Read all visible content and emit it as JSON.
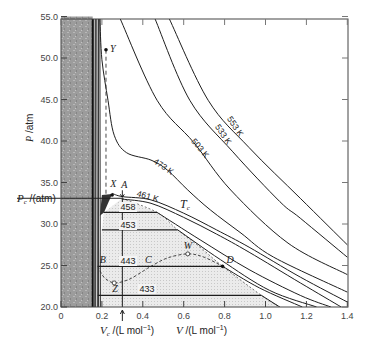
{
  "chart_data": {
    "type": "line",
    "title": "",
    "xlabel": "V /(L mol^-1)",
    "xlabel_critical": "Vc /(L mol^-1)",
    "ylabel": "P /atm",
    "ylabel_critical": "Pc /(atm)",
    "xlim": [
      0,
      1.4
    ],
    "ylim": [
      20.0,
      55.0
    ],
    "grid": false,
    "x_ticks": [
      "0",
      "0.2",
      "0.4",
      "0.6",
      "0.8",
      "1.0",
      "1.2",
      "1.4"
    ],
    "x_tick_values": [
      0,
      0.2,
      0.4,
      0.6,
      0.8,
      1.0,
      1.2,
      1.4
    ],
    "y_ticks": [
      "20.0",
      "25.0",
      "30.0",
      "35.0",
      "40.0",
      "45.0",
      "50.0",
      "55.0"
    ],
    "y_tick_values": [
      20,
      25,
      30,
      35,
      40,
      45,
      50,
      55
    ],
    "critical_point": {
      "V": 0.3,
      "P": 33.1,
      "label": "A"
    },
    "series": [
      {
        "name": "553 K",
        "label": "553 K",
        "points": [
          [
            0.53,
            54.7
          ],
          [
            0.72,
            44.9
          ],
          [
            0.92,
            39.2
          ],
          [
            1.17,
            33.1
          ],
          [
            1.4,
            27.5
          ]
        ]
      },
      {
        "name": "533 K",
        "label": "533 K",
        "points": [
          [
            0.46,
            54.7
          ],
          [
            0.63,
            44.9
          ],
          [
            0.84,
            38.7
          ],
          [
            1.07,
            32.7
          ],
          [
            1.17,
            30.7
          ],
          [
            1.4,
            26.0
          ]
        ]
      },
      {
        "name": "503 K",
        "label": "503 K",
        "points": [
          [
            0.29,
            54.7
          ],
          [
            0.47,
            44.9
          ],
          [
            0.65,
            39.8
          ],
          [
            0.83,
            34.1
          ],
          [
            1.11,
            27.7
          ],
          [
            1.4,
            23.9
          ]
        ]
      },
      {
        "name": "473 K",
        "label": "473 K",
        "points": [
          [
            0.19,
            54.7
          ],
          [
            0.2,
            49.8
          ],
          [
            0.23,
            44.9
          ],
          [
            0.26,
            40.7
          ],
          [
            0.32,
            38.6
          ],
          [
            0.44,
            37.7
          ],
          [
            0.52,
            36.5
          ],
          [
            0.62,
            34.1
          ],
          [
            0.73,
            31.7
          ],
          [
            0.88,
            28.9
          ],
          [
            1.04,
            26.0
          ],
          [
            1.4,
            21.8
          ]
        ]
      },
      {
        "name": "461 K",
        "label": "461 K",
        "points": [
          [
            0.25,
            33.7
          ],
          [
            0.3,
            33.3
          ],
          [
            0.44,
            32.9
          ],
          [
            0.6,
            31.3
          ],
          [
            0.76,
            29.3
          ],
          [
            0.92,
            27.2
          ],
          [
            1.17,
            23.6
          ],
          [
            1.4,
            20.6
          ]
        ]
      },
      {
        "name": "Tc",
        "label": "Tc",
        "points": [
          [
            0.3,
            33.0
          ],
          [
            0.44,
            32.5
          ],
          [
            0.6,
            30.8
          ],
          [
            0.76,
            28.8
          ],
          [
            0.92,
            26.6
          ],
          [
            1.17,
            22.9
          ],
          [
            1.37,
            20.0
          ]
        ]
      },
      {
        "name": "458 K",
        "label": "458",
        "points": [
          [
            0.47,
            31.4
          ],
          [
            0.68,
            28.1
          ],
          [
            0.92,
            24.5
          ],
          [
            1.17,
            21.4
          ],
          [
            1.32,
            20.0
          ]
        ]
      },
      {
        "name": "453 K",
        "label": "453",
        "points": [
          [
            0.57,
            29.3
          ],
          [
            0.78,
            25.7
          ],
          [
            1.02,
            22.0
          ],
          [
            1.25,
            20.0
          ]
        ]
      },
      {
        "name": "443 K",
        "label": "443",
        "points": [
          [
            0.79,
            24.9
          ],
          [
            0.97,
            22.3
          ],
          [
            1.18,
            20.0
          ]
        ]
      },
      {
        "name": "433 K",
        "label": "433",
        "points": [
          [
            0.98,
            21.4
          ],
          [
            1.07,
            20.0
          ]
        ]
      }
    ],
    "tie_lines": [
      {
        "T": "458",
        "P": 31.4,
        "V_liquid": 0.21,
        "V_gas": 0.47
      },
      {
        "T": "453",
        "P": 29.3,
        "V_liquid": 0.2,
        "V_gas": 0.57
      },
      {
        "T": "443",
        "P": 24.9,
        "V_liquid": 0.18,
        "V_gas": 0.79
      },
      {
        "T": "433",
        "P": 21.4,
        "V_liquid": 0.18,
        "V_gas": 0.98
      }
    ],
    "two_phase_region": [
      [
        0.18,
        20
      ],
      [
        0.18,
        24.9
      ],
      [
        0.2,
        29.3
      ],
      [
        0.21,
        31.4
      ],
      [
        0.3,
        33.1
      ],
      [
        0.47,
        31.4
      ],
      [
        0.57,
        29.3
      ],
      [
        0.68,
        27.2
      ],
      [
        0.79,
        24.9
      ],
      [
        0.98,
        21.4
      ],
      [
        1.07,
        20
      ]
    ],
    "liquid_region_V_max": 0.155,
    "liquid_branches_V": [
      0.155,
      0.16,
      0.168,
      0.175,
      0.183,
      0.19
    ],
    "van_der_waals_loop": [
      [
        0.18,
        24.9
      ],
      [
        0.21,
        23.6
      ],
      [
        0.26,
        22.9
      ],
      [
        0.33,
        23.3
      ],
      [
        0.4,
        24.3
      ],
      [
        0.44,
        24.9
      ],
      [
        0.52,
        25.9
      ],
      [
        0.62,
        26.4
      ],
      [
        0.7,
        26.0
      ],
      [
        0.79,
        24.9
      ]
    ],
    "y_dashed_line": {
      "V": 0.22,
      "P_top": 51.0,
      "P_bottom": 33.3
    },
    "annotations": [
      {
        "label": "Y",
        "V": 0.22,
        "P": 51.0,
        "marker": "filled",
        "dx": 4,
        "dy": 2
      },
      {
        "label": "X",
        "V": 0.25,
        "P": 33.5,
        "marker": "filled",
        "dx": -2,
        "dy": -8
      },
      {
        "label": "A",
        "V": 0.3,
        "P": 33.1,
        "marker": "arrow",
        "dx": -1,
        "dy": -10
      },
      {
        "label": "B",
        "V": 0.18,
        "P": 24.9,
        "marker": "none",
        "dx": 2,
        "dy": -3
      },
      {
        "label": "Z",
        "V": 0.26,
        "P": 22.9,
        "marker": "open",
        "dx": -2,
        "dy": 9
      },
      {
        "label": "C",
        "V": 0.44,
        "P": 24.9,
        "marker": "none",
        "dx": -6,
        "dy": -3
      },
      {
        "label": "W",
        "V": 0.62,
        "P": 26.4,
        "marker": "open",
        "dx": -4,
        "dy": -5
      },
      {
        "label": "D",
        "V": 0.79,
        "P": 24.9,
        "marker": "filled",
        "dx": 4,
        "dy": -3
      }
    ],
    "curve_labels": [
      {
        "text": "553 K",
        "x": 233,
        "y": 128,
        "angle": 56
      },
      {
        "text": "533 K",
        "x": 221,
        "y": 136,
        "angle": 56
      },
      {
        "text": "503 K",
        "x": 198,
        "y": 150,
        "angle": 50
      },
      {
        "text": "473 K",
        "x": 162,
        "y": 169,
        "angle": 34
      },
      {
        "text": "461 K",
        "x": 147,
        "y": 199,
        "angle": 16
      }
    ],
    "tie_labels": [
      {
        "text": "458",
        "x": 128,
        "y": 210
      },
      {
        "text": "453",
        "x": 128,
        "y": 228
      },
      {
        "text": "443",
        "x": 128,
        "y": 264
      },
      {
        "text": "433",
        "x": 147,
        "y": 292
      }
    ],
    "tc_label": {
      "main": "T",
      "sub": "c",
      "x": 180,
      "y": 208
    }
  },
  "axes": {
    "y_title_main": "P",
    "y_title_unit": " /atm",
    "pc_label_main": "P",
    "pc_label_sub": "c",
    "pc_label_unit": " /(atm)",
    "vc_label_main": "V",
    "vc_label_sub": "c",
    "vc_label_unit": " /(L mol",
    "v_label_main": "V",
    "v_label_unit": "  /(L mol",
    "exp": "−1",
    "close_paren": ")"
  }
}
